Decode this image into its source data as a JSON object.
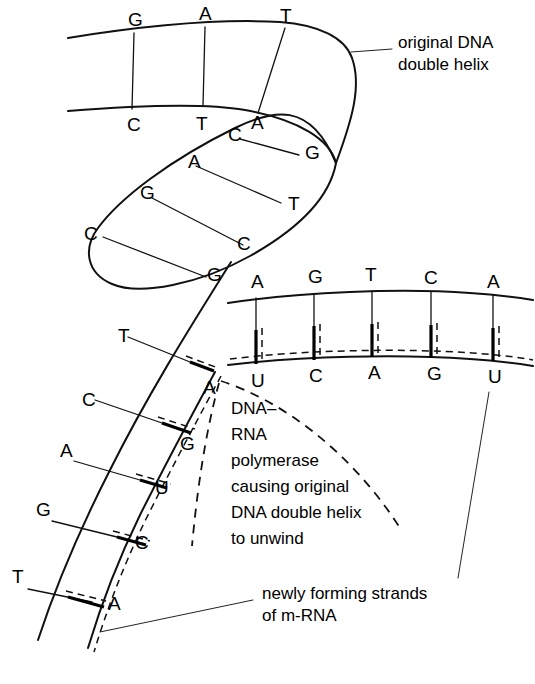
{
  "figure": {
    "background_color": "#ffffff",
    "ink_color": "#111111"
  },
  "labels": {
    "original_helix": {
      "line1": "original DNA",
      "line2": "double helix"
    },
    "polymerase": {
      "line1": "DNA–",
      "line2": "RNA",
      "line3": "polymerase",
      "line4": "causing original",
      "line5": "DNA double helix",
      "line6": "to unwind"
    },
    "mrna": {
      "line1": "newly forming strands",
      "line2": "of m-RNA"
    }
  },
  "bases": {
    "top_helix_upper": [
      "G",
      "A",
      "T"
    ],
    "top_helix_lower": [
      "C",
      "T",
      "A"
    ],
    "loop_outer": [
      "C",
      "A",
      "C",
      "G"
    ],
    "loop_inner": [
      "C",
      "G",
      "T",
      "G"
    ],
    "left_dna_template": [
      "T",
      "C",
      "A",
      "G",
      "T"
    ],
    "left_mrna": [
      "A",
      "G",
      "U",
      "C",
      "A"
    ],
    "right_dna_template": [
      "A",
      "G",
      "T",
      "C",
      "A"
    ],
    "right_mrna": [
      "U",
      "C",
      "A",
      "G",
      "U"
    ]
  },
  "glyphs": {
    "top_upper": [
      {
        "letter": "G",
        "x": 128,
        "y": 26
      },
      {
        "letter": "A",
        "x": 199,
        "y": 20
      },
      {
        "letter": "T",
        "x": 280,
        "y": 22
      }
    ],
    "top_lower": [
      {
        "letter": "C",
        "x": 127,
        "y": 131
      },
      {
        "letter": "T",
        "x": 196,
        "y": 130
      },
      {
        "letter": "A",
        "x": 251,
        "y": 129
      }
    ],
    "loop_outer": [
      {
        "letter": "C",
        "x": 228,
        "y": 141
      },
      {
        "letter": "A",
        "x": 188,
        "y": 168
      },
      {
        "letter": "G",
        "x": 140,
        "y": 199
      },
      {
        "letter": "C",
        "x": 84,
        "y": 240
      }
    ],
    "loop_inner": [
      {
        "letter": "G",
        "x": 305,
        "y": 159
      },
      {
        "letter": "T",
        "x": 288,
        "y": 210
      },
      {
        "letter": "C",
        "x": 237,
        "y": 250
      },
      {
        "letter": "G",
        "x": 207,
        "y": 281
      }
    ],
    "left_dna": [
      {
        "letter": "T",
        "x": 118,
        "y": 342
      },
      {
        "letter": "C",
        "x": 82,
        "y": 406
      },
      {
        "letter": "A",
        "x": 60,
        "y": 457
      },
      {
        "letter": "G",
        "x": 36,
        "y": 516
      },
      {
        "letter": "T",
        "x": 12,
        "y": 583
      }
    ],
    "left_mrna": [
      {
        "letter": "A",
        "x": 203,
        "y": 394
      },
      {
        "letter": "G",
        "x": 180,
        "y": 450
      },
      {
        "letter": "U",
        "x": 155,
        "y": 494
      },
      {
        "letter": "C",
        "x": 135,
        "y": 549
      },
      {
        "letter": "A",
        "x": 108,
        "y": 610
      }
    ],
    "right_dna": [
      {
        "letter": "A",
        "x": 251,
        "y": 288
      },
      {
        "letter": "G",
        "x": 308,
        "y": 283
      },
      {
        "letter": "T",
        "x": 365,
        "y": 281
      },
      {
        "letter": "C",
        "x": 424,
        "y": 284
      },
      {
        "letter": "A",
        "x": 487,
        "y": 288
      }
    ],
    "right_mrna": [
      {
        "letter": "U",
        "x": 251,
        "y": 387
      },
      {
        "letter": "C",
        "x": 309,
        "y": 382
      },
      {
        "letter": "A",
        "x": 368,
        "y": 379
      },
      {
        "letter": "G",
        "x": 427,
        "y": 380
      },
      {
        "letter": "U",
        "x": 488,
        "y": 383
      }
    ]
  }
}
